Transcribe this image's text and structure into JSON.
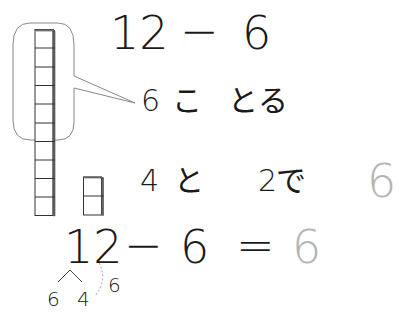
{
  "worksheet": {
    "problem": {
      "left": "12",
      "operator": "−",
      "right": "6"
    },
    "step1": {
      "number": "6",
      "counter": "こ",
      "verb": "とる"
    },
    "step2": {
      "a": "4",
      "particle": "と",
      "b": "2",
      "particle2": "で",
      "answer": "6"
    },
    "equation": {
      "left": "12",
      "operator": "−",
      "right": "6",
      "equals": "=",
      "answer": "6"
    },
    "decomposition": {
      "part_a": "6",
      "part_b": "4",
      "take": "6"
    },
    "blocks": {
      "ten_stick_count": 10,
      "loose_count": 2,
      "callout_covers": 6
    },
    "colors": {
      "ink": "#1a1a1a",
      "answer_gray": "#b4b4b4",
      "callout": "#888888",
      "dashed": "#999999"
    }
  }
}
